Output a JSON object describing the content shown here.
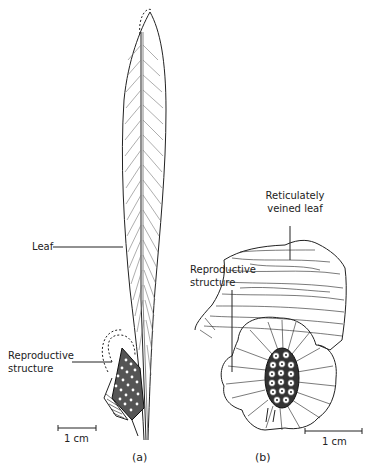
{
  "panel_a": {
    "caption": "(a)",
    "labels": {
      "leaf": "Leaf",
      "repro_line1": "Reproductive",
      "repro_line2": "structure"
    },
    "scale_bar": "1 cm"
  },
  "panel_b": {
    "caption": "(b)",
    "labels": {
      "leaf_line1": "Reticulately",
      "leaf_line2": "veined leaf",
      "repro_line1": "Reproductive",
      "repro_line2": "structure"
    },
    "scale_bar": "1 cm"
  },
  "colors": {
    "ink": "#222222",
    "background": "#ffffff"
  }
}
